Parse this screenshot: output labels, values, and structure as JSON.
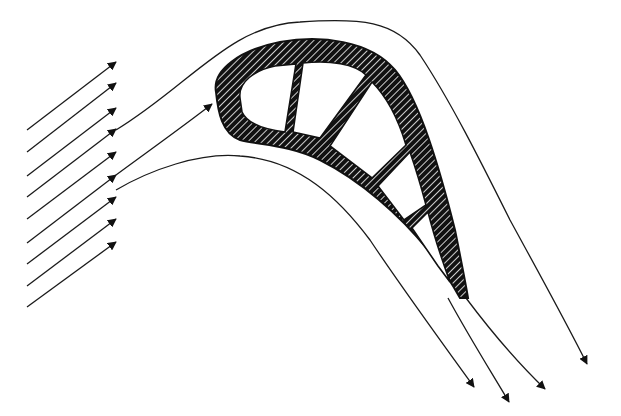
{
  "diagram": {
    "title": "",
    "colors": {
      "background": "#ffffff",
      "ink": "#111111",
      "hatch_gap": "#ffffff"
    },
    "inflow_arrows": [
      {
        "x1": 27,
        "y1": 130,
        "x2": 116,
        "y2": 62
      },
      {
        "x1": 27,
        "y1": 152,
        "x2": 116,
        "y2": 83
      },
      {
        "x1": 27,
        "y1": 176,
        "x2": 116,
        "y2": 108
      },
      {
        "x1": 27,
        "y1": 197,
        "x2": 116,
        "y2": 129
      },
      {
        "x1": 27,
        "y1": 219,
        "x2": 116,
        "y2": 152
      },
      {
        "x1": 27,
        "y1": 243,
        "x2": 116,
        "y2": 175
      },
      {
        "x1": 27,
        "y1": 264,
        "x2": 116,
        "y2": 197
      },
      {
        "x1": 27,
        "y1": 286,
        "x2": 116,
        "y2": 219
      },
      {
        "x1": 27,
        "y1": 307,
        "x2": 116,
        "y2": 242
      }
    ],
    "outflow_arrow_heads": [
      {
        "x": 474,
        "y": 387
      },
      {
        "x": 509,
        "y": 402
      },
      {
        "x": 545,
        "y": 389
      },
      {
        "x": 587,
        "y": 364
      }
    ],
    "labels": []
  }
}
